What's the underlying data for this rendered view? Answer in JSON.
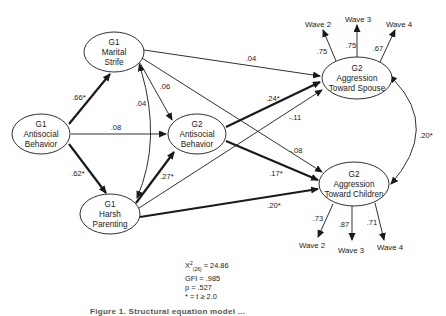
{
  "diagram": {
    "type": "structural-equation-path-model",
    "nodes": {
      "g1_antisocial": {
        "lines": [
          "G1",
          "Antisocial",
          "Behavior"
        ]
      },
      "g1_marital": {
        "lines": [
          "G1",
          "Marital",
          "Strife"
        ]
      },
      "g1_harsh": {
        "lines": [
          "G1",
          "Harsh",
          "Parenting"
        ]
      },
      "g2_antisocial": {
        "lines": [
          "G2",
          "Antisocial",
          "Behavior"
        ]
      },
      "g2_spouse": {
        "lines": [
          "G2",
          "Aggression",
          "Toward Spouse"
        ]
      },
      "g2_children": {
        "lines": [
          "G2",
          "Aggression",
          "Toward Children"
        ]
      }
    },
    "paths": {
      "antisocial_to_marital": ".66*",
      "antisocial_to_harsh": ".62*",
      "antisocial_to_g2antisocial": ".08",
      "marital_harsh_correlation": ".04",
      "marital_to_g2antisocial": ".06",
      "marital_to_spouse": ".04",
      "marital_to_children": "-.08",
      "harsh_to_g2antisocial": ".27*",
      "harsh_to_spouse": "-.11",
      "harsh_to_children": ".20*",
      "g2antisocial_to_spouse": ".24*",
      "g2antisocial_to_children": ".17*",
      "spouse_children_correlation": ".20*"
    },
    "spouse_indicators": [
      {
        "label": "Wave 2",
        "loading": ".75"
      },
      {
        "label": "Wave 3",
        "loading": ".75"
      },
      {
        "label": "Wave 4",
        "loading": ".67"
      }
    ],
    "children_indicators": [
      {
        "label": "Wave 2",
        "loading": ".73"
      },
      {
        "label": "Wave 3",
        "loading": ".87"
      },
      {
        "label": "Wave 4",
        "loading": ".71"
      }
    ],
    "fit_stats": {
      "chi_square_symbol": "X",
      "chi_square_sup": "2",
      "chi_square_sub": "(26)",
      "chi_square_value": " = 24.86",
      "gfi": "GFI = .985",
      "p": "p = .527",
      "note": "* = t ≥ 2.0"
    },
    "caption": "Figure 1. Structural equation model ..."
  }
}
